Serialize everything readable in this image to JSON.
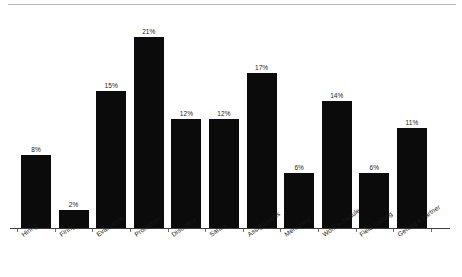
{
  "chart_data": {
    "type": "bar",
    "title": "",
    "subtitle": "",
    "xlabel": "",
    "ylabel": "",
    "grid": false,
    "legend": null,
    "value_suffix": "%",
    "ylim": [
      0,
      21
    ],
    "categories": [
      "Hiring",
      "Firing",
      "Evaluation",
      "Promotion",
      "Discipline",
      "Salary",
      "Assignments",
      "Mentoring",
      "Work schedule",
      "Field training",
      "Getting a partner"
    ],
    "values": [
      8,
      2,
      15,
      21,
      12,
      12,
      17,
      6,
      14,
      6,
      11
    ],
    "data_labels": [
      "8%",
      "2%",
      "15%",
      "21%",
      "12%",
      "12%",
      "17%",
      "6%",
      "14%",
      "6%",
      "11%"
    ],
    "colors": {
      "bar": "#0b0b0b",
      "axis": "#3c3c3c",
      "tick": "#6b6b6b",
      "text": "#1a1a1a",
      "top_rule": "#b9b9b9",
      "background": "#ffffff"
    }
  }
}
